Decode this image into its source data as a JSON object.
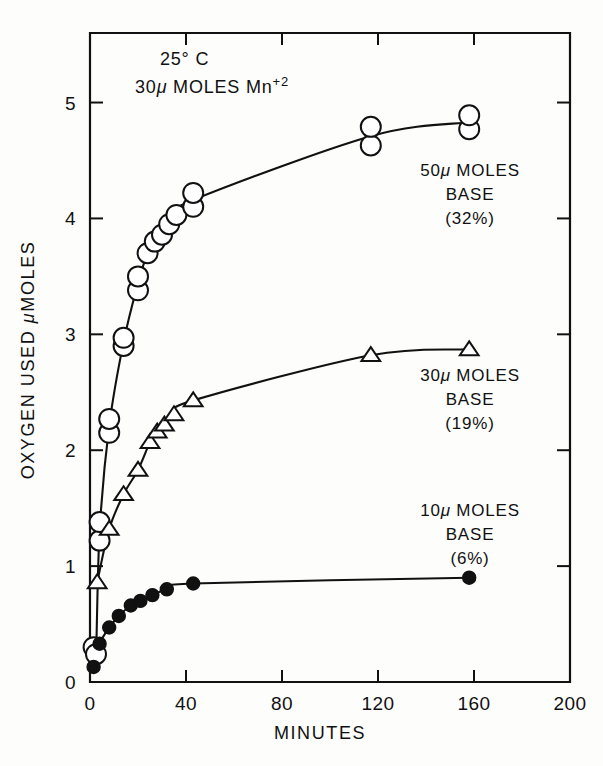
{
  "figure": {
    "annotation_line1": "25° C",
    "annotation_line2_pre": "30",
    "annotation_line2_mu": "μ",
    "annotation_line2_mid": " MOLES",
    "annotation_line2_species": "Mn",
    "annotation_line2_charge": "+2"
  },
  "chart_data": {
    "type": "line",
    "title": "",
    "subtitle": "",
    "xlabel": "MINUTES",
    "ylabel": "OXYGEN USED μMOLES",
    "xlim": [
      0,
      200
    ],
    "ylim": [
      0,
      5.6
    ],
    "xticks": [
      0,
      40,
      80,
      120,
      160,
      200
    ],
    "xtick_labels": [
      "0",
      "40",
      "80",
      "120",
      "160",
      "200"
    ],
    "yticks": [
      1,
      2,
      3,
      4,
      5
    ],
    "ytick_labels": [
      "1",
      "2",
      "3",
      "4",
      "5"
    ],
    "grid": false,
    "legend": "inline-right-annotations",
    "annotations": [
      {
        "name": "conditions",
        "text": "25° C / 30μ MOLES Mn+2",
        "x": 28,
        "y": 5.35
      }
    ],
    "series": [
      {
        "name": "50μ MOLES BASE (32%)",
        "label_lines": [
          "50μ MOLES",
          "BASE",
          "(32%)"
        ],
        "marker": "open-circle",
        "percent": "32%",
        "base_umoles": 50,
        "x": [
          1.5,
          2.5,
          4,
          4,
          8,
          8,
          14,
          14,
          20,
          20,
          24,
          27,
          30,
          33,
          36,
          43,
          43,
          117,
          117,
          158,
          158
        ],
        "y": [
          0.3,
          0.24,
          1.22,
          1.38,
          2.15,
          2.27,
          2.9,
          2.97,
          3.38,
          3.5,
          3.7,
          3.8,
          3.86,
          3.95,
          4.03,
          4.1,
          4.22,
          4.63,
          4.79,
          4.77,
          4.89
        ]
      },
      {
        "name": "30μ MOLES BASE (19%)",
        "label_lines": [
          "30μ MOLES",
          "BASE",
          "(19%)"
        ],
        "marker": "open-triangle",
        "percent": "19%",
        "base_umoles": 30,
        "x": [
          3,
          8,
          14,
          20,
          25,
          28,
          31,
          35,
          43,
          117,
          158
        ],
        "y": [
          0.86,
          1.32,
          1.62,
          1.83,
          2.07,
          2.16,
          2.22,
          2.31,
          2.43,
          2.82,
          2.87
        ]
      },
      {
        "name": "10μ MOLES BASE (6%)",
        "label_lines": [
          "10μ MOLES",
          "BASE",
          "(6%)"
        ],
        "marker": "filled-circle",
        "percent": "6%",
        "base_umoles": 10,
        "x": [
          1.5,
          4,
          8,
          12,
          17,
          21,
          26,
          32,
          43,
          158
        ],
        "y": [
          0.13,
          0.33,
          0.47,
          0.57,
          0.66,
          0.7,
          0.75,
          0.8,
          0.85,
          0.9
        ]
      }
    ]
  },
  "series_labels": [
    {
      "id": "label-50u",
      "line1": "50μ MOLES",
      "line2": "BASE",
      "line3": "(32%)",
      "px": 470,
      "py": 176
    },
    {
      "id": "label-30u",
      "line1": "30μ MOLES",
      "line2": "BASE",
      "line3": "(19%)",
      "px": 470,
      "py": 381
    },
    {
      "id": "label-10u",
      "line1": "10μ MOLES",
      "line2": "BASE",
      "line3": "(6%)",
      "px": 470,
      "py": 516
    }
  ]
}
